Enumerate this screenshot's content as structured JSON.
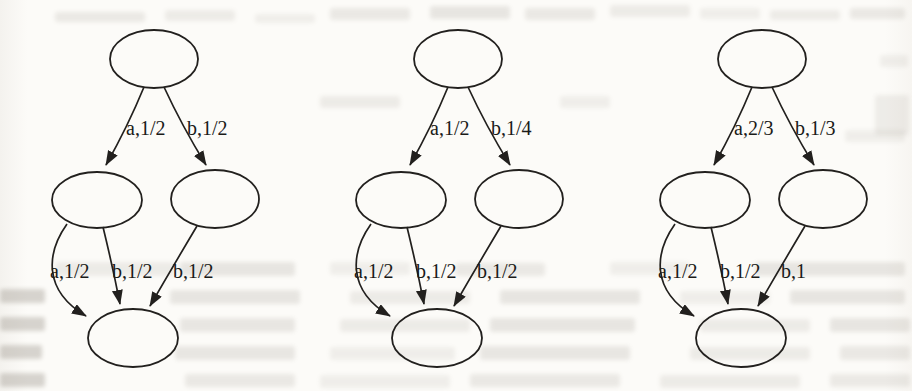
{
  "colors": {
    "paper": "#fcfbf8",
    "stroke": "#22201e",
    "label_text": "#1a1a18",
    "bleed_text": "#776f63"
  },
  "diagram": {
    "kind": "probabilistic-automata-figure",
    "graphs": [
      {
        "name": "automaton-1",
        "nodes": [
          {
            "id": "top"
          },
          {
            "id": "mid-left"
          },
          {
            "id": "mid-right"
          },
          {
            "id": "bottom"
          }
        ],
        "edges": [
          {
            "from": "top",
            "to": "mid-left",
            "label": "a,1/2"
          },
          {
            "from": "top",
            "to": "mid-right",
            "label": "b,1/2"
          },
          {
            "from": "mid-left",
            "to": "bottom",
            "label": "a,1/2",
            "curved": true
          },
          {
            "from": "mid-left",
            "to": "bottom",
            "label": "b,1/2"
          },
          {
            "from": "mid-right",
            "to": "bottom",
            "label": "b,1/2"
          }
        ]
      },
      {
        "name": "automaton-2",
        "nodes": [
          {
            "id": "top"
          },
          {
            "id": "mid-left"
          },
          {
            "id": "mid-right"
          },
          {
            "id": "bottom"
          }
        ],
        "edges": [
          {
            "from": "top",
            "to": "mid-left",
            "label": "a,1/2"
          },
          {
            "from": "top",
            "to": "mid-right",
            "label": "b,1/4"
          },
          {
            "from": "mid-left",
            "to": "bottom",
            "label": "a,1/2",
            "curved": true
          },
          {
            "from": "mid-left",
            "to": "bottom",
            "label": "b,1/2"
          },
          {
            "from": "mid-right",
            "to": "bottom",
            "label": "b,1/2"
          }
        ]
      },
      {
        "name": "automaton-3",
        "nodes": [
          {
            "id": "top"
          },
          {
            "id": "mid-left"
          },
          {
            "id": "mid-right"
          },
          {
            "id": "bottom"
          }
        ],
        "edges": [
          {
            "from": "top",
            "to": "mid-left",
            "label": "a,2/3"
          },
          {
            "from": "top",
            "to": "mid-right",
            "label": "b,1/3"
          },
          {
            "from": "mid-left",
            "to": "bottom",
            "label": "a,1/2",
            "curved": true
          },
          {
            "from": "mid-left",
            "to": "bottom",
            "label": "b,1/2"
          },
          {
            "from": "mid-right",
            "to": "bottom",
            "label": "b,1"
          }
        ]
      }
    ]
  }
}
